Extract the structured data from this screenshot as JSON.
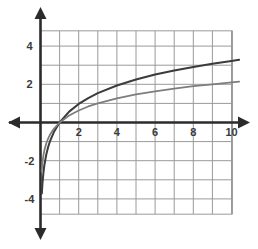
{
  "chart_data": {
    "type": "line",
    "title": "",
    "subtitle": "",
    "xlabel": "",
    "ylabel": "",
    "xlim": [
      -0.55,
      10.45
    ],
    "ylim": [
      -4.85,
      4.85
    ],
    "grid": true,
    "grid_step_x": 1,
    "grid_step_y": 1,
    "legend": "none",
    "axis_style": "double-arrow-cartesian",
    "x_ticks": [
      2,
      4,
      6,
      8,
      10
    ],
    "x_tick_labels": [
      "2",
      "4",
      "6",
      "8",
      "10"
    ],
    "y_ticks": [
      4,
      2,
      -2,
      -4
    ],
    "y_tick_labels": [
      "4",
      "2",
      "-2",
      "-4"
    ],
    "x_axis_value": 0,
    "y_axis_value": 0,
    "common_root": [
      1,
      0
    ],
    "vertical_asymptote": 0,
    "series": [
      {
        "name": "upper-log-curve",
        "color": "#3b3b3b",
        "width": 2.0,
        "coefficient": 1.4,
        "function": "1.4*ln(x)",
        "x": [
          0.07,
          0.1,
          0.15,
          0.2,
          0.3,
          0.4,
          0.5,
          0.7,
          1.0,
          1.5,
          2.0,
          2.5,
          3.0,
          4.0,
          5.0,
          6.0,
          7.0,
          8.0,
          9.0,
          10.0,
          10.4
        ],
        "y": [
          -3.72,
          -3.22,
          -2.66,
          -2.25,
          -1.69,
          -1.28,
          -0.97,
          -0.5,
          0.0,
          0.57,
          0.97,
          1.28,
          1.54,
          1.94,
          2.25,
          2.51,
          2.72,
          2.91,
          3.08,
          3.22,
          3.28
        ]
      },
      {
        "name": "lower-log-curve",
        "color": "#7d7d7d",
        "width": 1.8,
        "coefficient": 0.912,
        "function": "0.912*ln(x)",
        "x": [
          0.06,
          0.1,
          0.15,
          0.2,
          0.3,
          0.4,
          0.5,
          0.7,
          1.0,
          1.5,
          2.0,
          2.5,
          3.0,
          4.0,
          5.0,
          6.0,
          7.0,
          8.0,
          9.0,
          10.0,
          10.4
        ],
        "y": [
          -2.57,
          -2.1,
          -1.73,
          -1.47,
          -1.1,
          -0.84,
          -0.63,
          -0.33,
          0.0,
          0.37,
          0.63,
          0.84,
          1.0,
          1.26,
          1.47,
          1.63,
          1.77,
          1.9,
          2.0,
          2.1,
          2.14
        ]
      }
    ],
    "colors": {
      "grid": "#9a9a9a",
      "axis": "#2b2b2b",
      "background": "#ffffff",
      "tick_text": "#3a3a3a"
    }
  }
}
